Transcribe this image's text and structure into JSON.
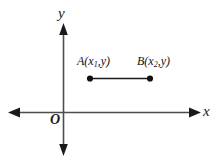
{
  "figure": {
    "type": "coordinate-plane-diagram",
    "background_color": "#ffffff",
    "axis_color": "#4d4d4d",
    "segment_color": "#1a1a1a",
    "point_color": "#111111",
    "axes": {
      "x_label": "x",
      "y_label": "y",
      "origin_label": "O"
    },
    "points": [
      {
        "name": "A",
        "label_full": "A(x₁,y)",
        "label_letter": "A",
        "label_open": "(",
        "label_var": "x",
        "label_sub": "1",
        "label_comma": ",",
        "label_y": "y",
        "label_close": ")",
        "x_px": 90,
        "y_px": 78
      },
      {
        "name": "B",
        "label_full": "B(x₂,y)",
        "label_letter": "B",
        "label_open": "(",
        "label_var": "x",
        "label_sub": "2",
        "label_comma": ",",
        "label_y": "y",
        "label_close": ")",
        "x_px": 150,
        "y_px": 78
      }
    ],
    "segment": {
      "name": "AB",
      "from": "A",
      "to": "B"
    }
  }
}
